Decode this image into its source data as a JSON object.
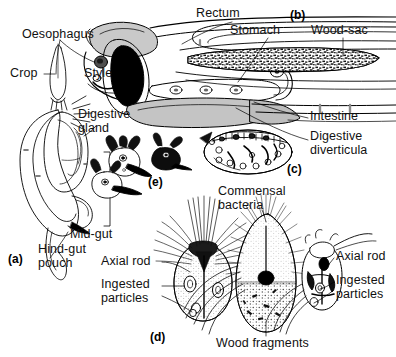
{
  "figure": {
    "width": 396,
    "height": 357,
    "background": "#ffffff",
    "ink": "#000000",
    "shade_light": "#d9d9d9",
    "shade_mid": "#b5b5b5",
    "shade_dark": "#8f8f8f"
  },
  "panels": [
    {
      "id": "(a)",
      "x": 8,
      "y": 252,
      "caption": "whole gut, lateral view"
    },
    {
      "id": "(b)",
      "x": 290,
      "y": 8,
      "caption": "enlarged anterior gut"
    },
    {
      "id": "(c)",
      "x": 287,
      "y": 162,
      "caption": "gut cross-section"
    },
    {
      "id": "(d)",
      "x": 150,
      "y": 330,
      "caption": "flagellate protozoan"
    },
    {
      "id": "(e)",
      "x": 148,
      "y": 175,
      "caption": "small flagellates"
    }
  ],
  "labels": [
    {
      "name": "oesophagus",
      "text": "Oesophagus",
      "x": 22,
      "y": 28,
      "align": "left"
    },
    {
      "name": "crop",
      "text": "Crop",
      "x": 10,
      "y": 74,
      "align": "left"
    },
    {
      "name": "style",
      "text": "Style",
      "x": 84,
      "y": 74,
      "align": "left"
    },
    {
      "name": "digestive-gland",
      "text": "Digestive\ngland",
      "x": 78,
      "y": 114,
      "align": "left"
    },
    {
      "name": "mid-gut",
      "text": "Mid-gut",
      "x": 70,
      "y": 228,
      "align": "left"
    },
    {
      "name": "hind-gut-pouch",
      "text": "Hind-gut\npouch",
      "x": 38,
      "y": 243,
      "align": "left"
    },
    {
      "name": "rectum",
      "text": "Rectum",
      "x": 196,
      "y": 10,
      "align": "left"
    },
    {
      "name": "stomach",
      "text": "Stomach",
      "x": 230,
      "y": 27,
      "align": "left"
    },
    {
      "name": "wood-sac",
      "text": "Wood-sac",
      "x": 311,
      "y": 27,
      "align": "left"
    },
    {
      "name": "intestine",
      "text": "Intestine",
      "x": 310,
      "y": 115,
      "align": "left"
    },
    {
      "name": "digestive-diverticula",
      "text": "Digestive\ndiverticula",
      "x": 310,
      "y": 133,
      "align": "left"
    },
    {
      "name": "axial-rod-left",
      "text": "Axial rod",
      "x": 101,
      "y": 258,
      "align": "left"
    },
    {
      "name": "ingested-particles-left",
      "text": "Ingested\nparticles",
      "x": 101,
      "y": 281,
      "align": "left"
    },
    {
      "name": "commensal-bacteria",
      "text": "Commensal\nbacteria",
      "x": 218,
      "y": 188,
      "align": "left"
    },
    {
      "name": "wood-fragments",
      "text": "Wood fragments",
      "x": 216,
      "y": 338,
      "align": "left"
    },
    {
      "name": "axial-rod-right",
      "text": "Axial rod",
      "x": 336,
      "y": 253,
      "align": "left"
    },
    {
      "name": "ingested-particles-right",
      "text": "Ingested\nparticles",
      "x": 336,
      "y": 277,
      "align": "left"
    }
  ]
}
